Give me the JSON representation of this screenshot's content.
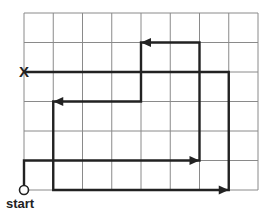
{
  "diagram": {
    "type": "grid-path",
    "grid": {
      "columns": 8,
      "rows": 6,
      "x0": 24,
      "y0": 13,
      "cell_w": 29.25,
      "cell_h": 29.5,
      "line_color": "#8a8a8a",
      "path_color": "#222222"
    },
    "start_label": "start",
    "end_marker": "X",
    "path_points": [
      [
        0,
        6
      ],
      [
        0,
        5
      ],
      [
        6,
        5
      ],
      [
        6,
        1
      ],
      [
        4,
        1
      ],
      [
        4,
        3
      ],
      [
        1,
        3
      ],
      [
        1,
        6
      ],
      [
        7,
        6
      ],
      [
        7,
        2
      ],
      [
        0,
        2
      ]
    ],
    "arrow_points": [
      [
        6,
        5
      ],
      [
        4,
        1
      ],
      [
        1,
        3
      ],
      [
        7,
        6
      ]
    ]
  }
}
